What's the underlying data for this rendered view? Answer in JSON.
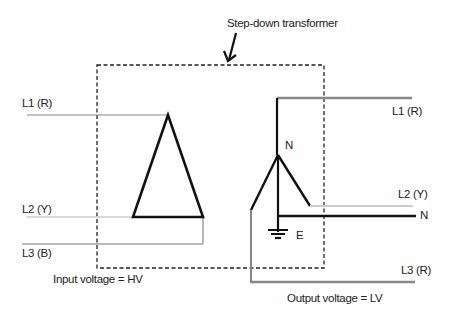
{
  "title": "Step-down transformer",
  "input": {
    "lines": [
      {
        "label": "L1 (R)",
        "color": "#888888"
      },
      {
        "label": "L2 (Y)",
        "color": "#cccccc"
      },
      {
        "label": "L3 (B)",
        "color": "#777777"
      }
    ],
    "voltage_label": "Input voltage = HV",
    "winding": "delta"
  },
  "output": {
    "lines": [
      {
        "label": "L1 (R)",
        "color": "#888888"
      },
      {
        "label": "L2 (Y)",
        "color": "#cccccc"
      },
      {
        "label": "N",
        "color": "#111111"
      },
      {
        "label": "L3 (R)",
        "color": "#888888"
      }
    ],
    "neutral_label": "N",
    "earth_label": "E",
    "voltage_label": "Output voltage = LV",
    "winding": "star"
  },
  "colors": {
    "winding": "#111111",
    "box_border": "#222222"
  }
}
